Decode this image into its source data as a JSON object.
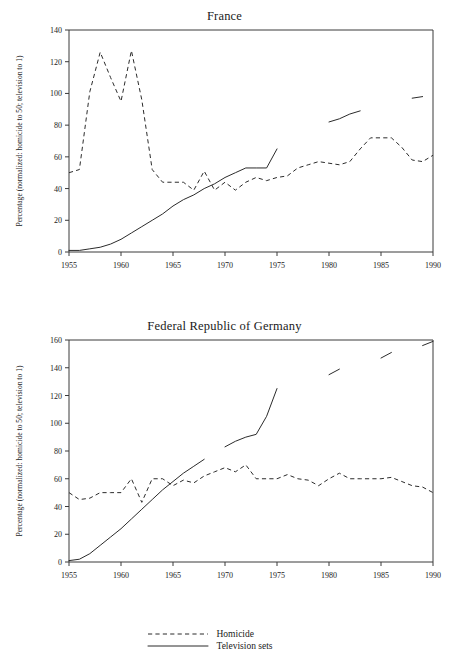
{
  "figure": {
    "ylabel": "Percentage (normalized: homicide to 50; television to 1)",
    "legend": {
      "items": [
        {
          "label": "Homicide",
          "style": "dashed"
        },
        {
          "label": "Television sets",
          "style": "solid"
        }
      ]
    }
  },
  "chart_data": [
    {
      "type": "line",
      "title": "France",
      "xlabel": "",
      "ylabel": "Percentage (normalized: homicide to 50; television to 1)",
      "xlim": [
        1955,
        1990
      ],
      "ylim": [
        0,
        140
      ],
      "xticks": [
        1955,
        1960,
        1965,
        1970,
        1975,
        1980,
        1985,
        1990
      ],
      "yticks": [
        0,
        20,
        40,
        60,
        80,
        100,
        120,
        140
      ],
      "grid": false,
      "legend_position": "below-figure",
      "series": [
        {
          "name": "Homicide",
          "style": "dashed",
          "x": [
            1955,
            1956,
            1957,
            1958,
            1959,
            1960,
            1961,
            1962,
            1963,
            1964,
            1965,
            1966,
            1967,
            1968,
            1969,
            1970,
            1971,
            1972,
            1973,
            1974,
            1975,
            1976,
            1977,
            1978,
            1979,
            1980,
            1981,
            1982,
            1983,
            1984,
            1985,
            1986,
            1987,
            1988,
            1989,
            1990
          ],
          "values": [
            50,
            52,
            101,
            126,
            110,
            95,
            127,
            96,
            52,
            44,
            44,
            44,
            39,
            51,
            39,
            44,
            39,
            44,
            47,
            45,
            47,
            48,
            53,
            55,
            57,
            56,
            55,
            57,
            65,
            72,
            72,
            72,
            66,
            58,
            57,
            61
          ]
        },
        {
          "name": "Television sets",
          "style": "solid",
          "segments": [
            {
              "x": [
                1955,
                1956,
                1957,
                1958,
                1959,
                1960,
                1961,
                1962,
                1963,
                1964,
                1965,
                1966,
                1967,
                1968,
                1969,
                1970,
                1971,
                1972,
                1973,
                1974,
                1975
              ],
              "values": [
                1,
                1,
                2,
                3,
                5,
                8,
                12,
                16,
                20,
                24,
                29,
                33,
                36,
                40,
                43,
                47,
                50,
                53,
                53,
                53,
                65
              ]
            },
            {
              "x": [
                1980,
                1981,
                1982,
                1983
              ],
              "values": [
                82,
                84,
                87,
                89
              ]
            },
            {
              "x": [
                1988,
                1989
              ],
              "values": [
                97,
                98
              ]
            }
          ]
        }
      ]
    },
    {
      "type": "line",
      "title": "Federal Republic of Germany",
      "xlabel": "",
      "ylabel": "Percentage (normalized: homicide to 50; television to 1)",
      "xlim": [
        1955,
        1990
      ],
      "ylim": [
        0,
        160
      ],
      "xticks": [
        1955,
        1960,
        1965,
        1970,
        1975,
        1980,
        1985,
        1990
      ],
      "yticks": [
        0,
        20,
        40,
        60,
        80,
        100,
        120,
        140,
        160
      ],
      "grid": false,
      "legend_position": "below-figure",
      "series": [
        {
          "name": "Homicide",
          "style": "dashed",
          "x": [
            1955,
            1956,
            1957,
            1958,
            1959,
            1960,
            1961,
            1962,
            1963,
            1964,
            1965,
            1966,
            1967,
            1968,
            1969,
            1970,
            1971,
            1972,
            1973,
            1974,
            1975,
            1976,
            1977,
            1978,
            1979,
            1980,
            1981,
            1982,
            1983,
            1984,
            1985,
            1986,
            1987,
            1988,
            1989,
            1990
          ],
          "values": [
            50,
            45,
            46,
            50,
            50,
            50,
            60,
            43,
            60,
            60,
            55,
            59,
            57,
            62,
            65,
            68,
            65,
            70,
            60,
            60,
            60,
            63,
            60,
            59,
            55,
            60,
            64,
            60,
            60,
            60,
            60,
            61,
            58,
            55,
            54,
            50
          ]
        },
        {
          "name": "Television sets",
          "style": "solid",
          "segments": [
            {
              "x": [
                1955,
                1956,
                1957,
                1958,
                1959,
                1960,
                1961,
                1962,
                1963,
                1964,
                1965,
                1966,
                1967,
                1968
              ],
              "values": [
                1,
                2,
                6,
                12,
                18,
                24,
                31,
                38,
                45,
                52,
                58,
                64,
                69,
                74
              ]
            },
            {
              "x": [
                1970,
                1971,
                1972,
                1973,
                1974,
                1975
              ],
              "values": [
                83,
                87,
                90,
                92,
                105,
                125
              ]
            },
            {
              "x": [
                1980,
                1981
              ],
              "values": [
                135,
                139
              ]
            },
            {
              "x": [
                1985,
                1986
              ],
              "values": [
                147,
                151
              ]
            },
            {
              "x": [
                1989,
                1990
              ],
              "values": [
                156,
                159
              ]
            }
          ]
        }
      ]
    }
  ]
}
